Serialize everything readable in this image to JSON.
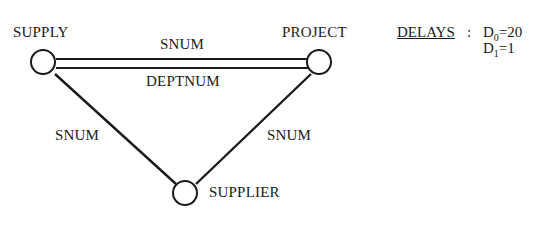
{
  "nodes": {
    "supply": "SUPPLY",
    "project": "PROJECT",
    "supplier": "SUPPLIER"
  },
  "edges": {
    "supply_project_top": "SNUM",
    "supply_project_bottom": "DEPTNUM",
    "supply_supplier": "SNUM",
    "project_supplier": "SNUM"
  },
  "delays": {
    "title": "DELAYS",
    "colon": ":",
    "d0": {
      "symbol": "D",
      "sub": "0",
      "value": "=20"
    },
    "d1": {
      "symbol": "D",
      "sub": "1",
      "value": "=1"
    }
  }
}
